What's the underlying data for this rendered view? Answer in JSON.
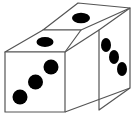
{
  "canvas": {
    "width": 138,
    "height": 123,
    "background_color": "#ffffff"
  },
  "illustration": {
    "subject": "two dice",
    "projection": "oblique",
    "face_fill_color": "#ffffff",
    "edge_color": "#555555",
    "pip_color": "#000000",
    "edge_width": 1.2
  },
  "objects": [
    {
      "name": "near-die",
      "faces": [
        {
          "name": "front-face",
          "pip_count": 3,
          "polygon": "5,52 65,52 65,112 5,112",
          "pips": [
            {
              "cx": 20,
              "cy": 97,
              "rx": 7.5,
              "ry": 7.5,
              "rotate": 0
            },
            {
              "cx": 35.5,
              "cy": 82,
              "rx": 7.5,
              "ry": 7.5,
              "rotate": 0
            },
            {
              "cx": 51,
              "cy": 67,
              "rx": 7.5,
              "ry": 7.5,
              "rotate": 0
            }
          ]
        },
        {
          "name": "top-face",
          "pip_count": 1,
          "polygon": "5,52 43,30 81,30 65,52",
          "pips": [
            {
              "cx": 45,
              "cy": 42,
              "rx": 8.5,
              "ry": 5.0,
              "rotate": 0
            }
          ]
        }
      ]
    },
    {
      "name": "far-die",
      "faces": [
        {
          "name": "top-face",
          "pip_count": 1,
          "polygon": "43,30 78,3 130,8 81,30",
          "pips": [
            {
              "cx": 81,
              "cy": 18,
              "rx": 9.0,
              "ry": 5.2,
              "rotate": 0
            }
          ]
        },
        {
          "name": "right-face",
          "pip_count": 3,
          "polygon": "99,30 130,8 130,88 99,110",
          "pips": [
            {
              "cx": 106,
              "cy": 45,
              "rx": 5.0,
              "ry": 7.0,
              "rotate": 0
            },
            {
              "cx": 114,
              "cy": 57,
              "rx": 5.0,
              "ry": 7.0,
              "rotate": 0
            },
            {
              "cx": 122,
              "cy": 69,
              "rx": 5.0,
              "ry": 7.0,
              "rotate": 0
            }
          ]
        }
      ]
    }
  ],
  "hidden_edges": [
    {
      "name": "near-die-right-edge",
      "from": "65,52",
      "to": "99,30"
    },
    {
      "name": "near-die-bottom-right-edge",
      "from": "65,112",
      "to": "99,110"
    },
    {
      "name": "body-bottom-edge",
      "from": "65,112",
      "to": "130,88"
    }
  ]
}
